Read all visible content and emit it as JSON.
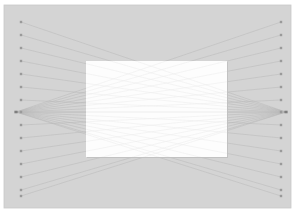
{
  "figure": {
    "title": "",
    "type": "bipartite-convergence-diagram",
    "width": 300,
    "height": 215,
    "background_color": "#ffffff"
  },
  "panel": {
    "label": "outer-gray-panel",
    "x": 4,
    "y": 5,
    "width": 287,
    "height": 203,
    "fill_color": "#d4d4d4",
    "stroke_color": "#c8c8c8"
  },
  "overlay_rect": {
    "label": "center-white-rectangle",
    "x": 86,
    "y": 61,
    "width": 141,
    "height": 96,
    "fill_color": "#fdfdfd",
    "shadow_color": "#c2c2c2"
  },
  "nodes": {
    "count_per_column": 15,
    "marker_shape": "square",
    "marker_size": 2.4,
    "marker_color": "#9a9a9a",
    "left_column_x": 21,
    "right_column_x": 281,
    "y_positions": [
      22,
      35,
      48,
      61,
      74,
      87,
      100,
      112,
      125,
      138,
      151,
      164,
      177,
      190,
      196
    ]
  },
  "convergence_points": [
    {
      "label": "left-focus",
      "x": 16,
      "y": 112
    },
    {
      "label": "right-focus",
      "x": 286,
      "y": 112
    }
  ],
  "edges": {
    "line_color_outer": "#b6b6b6",
    "line_color_inner": "#ededed",
    "line_width": 0.55,
    "opacity": 0.85,
    "description": "each node of one column links to the opposite column focus point"
  },
  "chart_data": {
    "type": "scatter",
    "title": "",
    "xlabel": "",
    "ylabel": "",
    "xlim": [
      0,
      300
    ],
    "ylim": [
      0,
      215
    ],
    "grid": false,
    "legend": null,
    "series": [
      {
        "name": "left-column-nodes",
        "x": [
          21,
          21,
          21,
          21,
          21,
          21,
          21,
          21,
          21,
          21,
          21,
          21,
          21,
          21,
          21
        ],
        "y": [
          22,
          35,
          48,
          61,
          74,
          87,
          100,
          112,
          125,
          138,
          151,
          164,
          177,
          190,
          196
        ]
      },
      {
        "name": "right-column-nodes",
        "x": [
          281,
          281,
          281,
          281,
          281,
          281,
          281,
          281,
          281,
          281,
          281,
          281,
          281,
          281,
          281
        ],
        "y": [
          22,
          35,
          48,
          61,
          74,
          87,
          100,
          112,
          125,
          138,
          151,
          164,
          177,
          190,
          196
        ]
      }
    ],
    "focus_points": [
      [
        16,
        112
      ],
      [
        286,
        112
      ]
    ]
  }
}
